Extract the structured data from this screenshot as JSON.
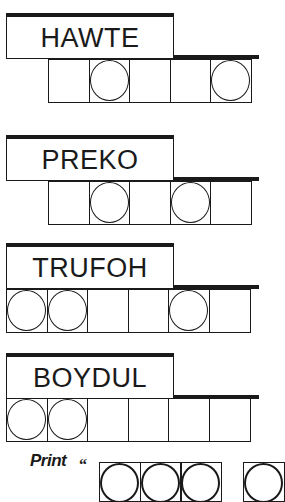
{
  "puzzles": [
    {
      "scrambled": "HAWTE",
      "letter_count": 5,
      "circled_positions": [
        2,
        5
      ],
      "tiles": [
        {
          "circled": false
        },
        {
          "circled": true
        },
        {
          "circled": false
        },
        {
          "circled": false
        },
        {
          "circled": true
        }
      ]
    },
    {
      "scrambled": "PREKO",
      "letter_count": 5,
      "circled_positions": [
        2,
        4
      ],
      "tiles": [
        {
          "circled": false
        },
        {
          "circled": true
        },
        {
          "circled": false
        },
        {
          "circled": true
        },
        {
          "circled": false
        }
      ]
    },
    {
      "scrambled": "TRUFOH",
      "letter_count": 6,
      "circled_positions": [
        1,
        2,
        5
      ],
      "tiles": [
        {
          "circled": true
        },
        {
          "circled": true
        },
        {
          "circled": false
        },
        {
          "circled": false
        },
        {
          "circled": true
        },
        {
          "circled": false
        }
      ]
    },
    {
      "scrambled": "BOYDUL",
      "letter_count": 6,
      "circled_positions": [
        1,
        2
      ],
      "tiles": [
        {
          "circled": true
        },
        {
          "circled": true
        },
        {
          "circled": false
        },
        {
          "circled": false
        },
        {
          "circled": false
        },
        {
          "circled": false
        }
      ]
    }
  ],
  "answer": {
    "print_label": "Print",
    "open_quote": "“",
    "groups": [
      {
        "tile_count": 3,
        "circled": [
          true,
          true,
          true
        ]
      },
      {
        "tile_count": 1,
        "circled": [
          true
        ]
      }
    ]
  },
  "colors": {
    "ink": "#1a1a1a",
    "background": "#ffffff"
  }
}
